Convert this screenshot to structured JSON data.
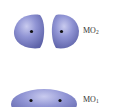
{
  "diagram": {
    "type": "molecular-orbital",
    "orbitals": [
      {
        "id": "mo2",
        "label_main": "MO",
        "label_sub": "2",
        "character": "antibonding",
        "lobes": 2,
        "nuclei": 2
      },
      {
        "id": "mo1",
        "label_main": "MO",
        "label_sub": "1",
        "character": "bonding",
        "lobes": 1,
        "nuclei": 2
      }
    ],
    "colors": {
      "lobe_fill": "#8a8fd0",
      "lobe_highlight": "#c4c7ee",
      "lobe_shadow": "#5d62a8",
      "nucleus": "#111111",
      "label_text": "#333333",
      "background": "#ffffff"
    }
  }
}
